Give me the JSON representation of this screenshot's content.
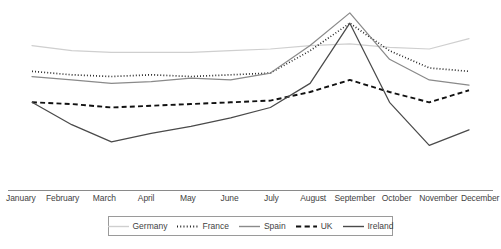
{
  "chart_data": {
    "type": "line",
    "title": "",
    "xlabel": "",
    "ylabel": "",
    "grid": false,
    "legend_position": "bottom",
    "categories": [
      "January",
      "February",
      "March",
      "April",
      "May",
      "June",
      "July",
      "August",
      "September",
      "October",
      "November",
      "December"
    ],
    "ylim": [
      0,
      100
    ],
    "y_axis_visible": false,
    "series": [
      {
        "name": "Germany",
        "color": "#cfcfcf",
        "style": "solid",
        "values": [
          77,
          74,
          73,
          73,
          73,
          74,
          75,
          77,
          78,
          76,
          75,
          81
        ]
      },
      {
        "name": "France",
        "color": "#1f1f1f",
        "style": "dotted",
        "values": [
          62,
          60,
          59,
          60,
          59,
          60,
          61,
          74,
          90,
          74,
          64,
          62
        ]
      },
      {
        "name": "Spain",
        "color": "#8a8a8a",
        "style": "solid",
        "values": [
          59,
          57,
          55,
          56,
          58,
          57,
          61,
          77,
          96,
          69,
          57,
          54
        ]
      },
      {
        "name": "UK",
        "color": "#111111",
        "style": "dashed",
        "values": [
          44,
          43,
          41,
          42,
          43,
          44,
          45,
          50,
          57,
          50,
          44,
          51
        ]
      },
      {
        "name": "Ireland",
        "color": "#4a4a4a",
        "style": "solid",
        "values": [
          44,
          31,
          21,
          26,
          30,
          35,
          41,
          55,
          90,
          44,
          19,
          28
        ]
      }
    ]
  },
  "legend": {
    "items": [
      {
        "label": "Germany",
        "icon": "line-swatch-solid-light"
      },
      {
        "label": "France",
        "icon": "line-swatch-dotted"
      },
      {
        "label": "Spain",
        "icon": "line-swatch-solid-gray"
      },
      {
        "label": "UK",
        "icon": "line-swatch-dashed"
      },
      {
        "label": "Ireland",
        "icon": "line-swatch-solid-dark"
      }
    ]
  },
  "axis": {
    "line_color": "#8a8a8a"
  }
}
